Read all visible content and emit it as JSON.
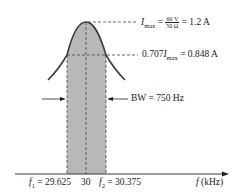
{
  "diagram": {
    "type": "resonance-curve",
    "peak_label": {
      "symbol": "I",
      "subscript": "max",
      "eq": "=",
      "frac_num": "60 V",
      "frac_den": "50 Ω",
      "result": "= 1.2 A"
    },
    "half_power_label": {
      "prefix": "0.707",
      "symbol": "I",
      "subscript": "max",
      "result": "= 0.848 A"
    },
    "bandwidth_label": "BW = 750 Hz",
    "axis": {
      "f1_symbol": "f",
      "f1_sub": "1",
      "f1_value": "= 29.625",
      "center": "30",
      "f2_symbol": "f",
      "f2_sub": "2",
      "f2_value": "= 30.375",
      "xlabel_symbol": "f",
      "xlabel_unit": "(kHz)"
    },
    "colors": {
      "shade": "#b8b8b8",
      "curve": "#3a3a3a",
      "dash": "#444444"
    }
  }
}
